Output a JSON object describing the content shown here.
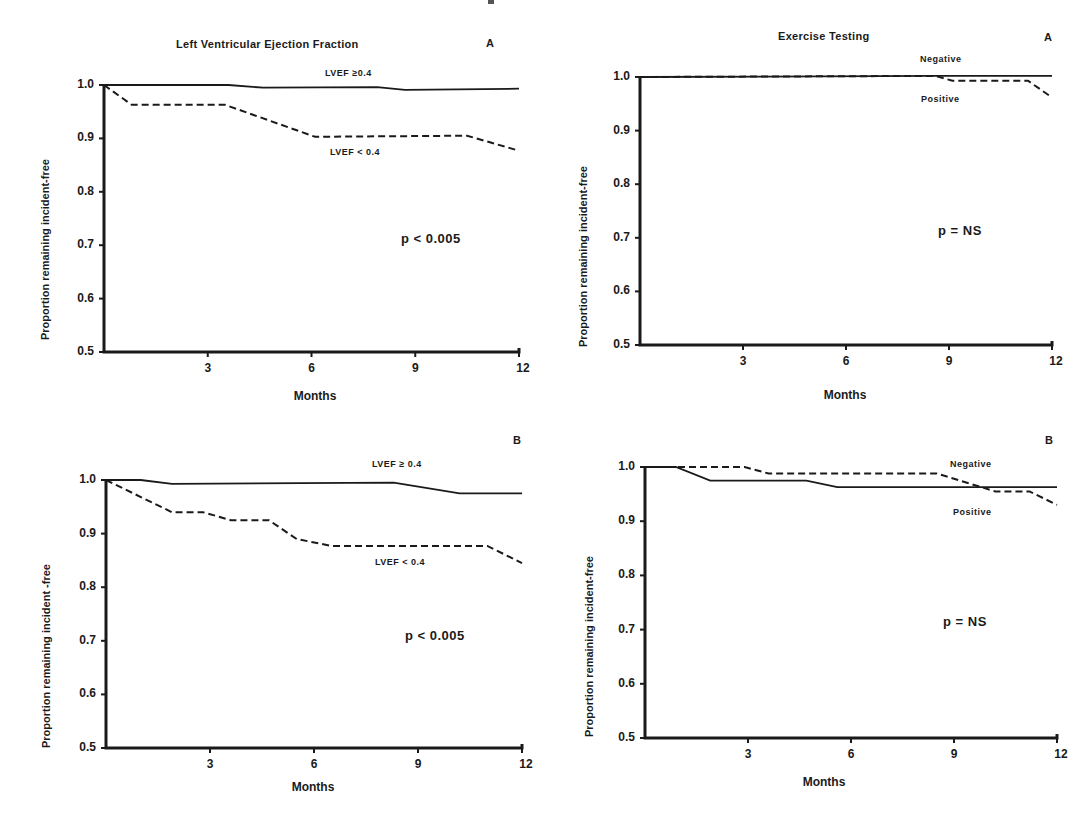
{
  "chart_data": [
    {
      "id": "tl",
      "type": "line",
      "title": "Left Ventricular Ejection Fraction",
      "panel_letter": "A",
      "xlabel": "Months",
      "ylabel": "Proportion remaining incident-free",
      "xlim": [
        0,
        12
      ],
      "ylim": [
        0.5,
        1.0
      ],
      "xticks": [
        "3",
        "6",
        "9",
        "12"
      ],
      "yticks": [
        "1.0",
        "0.9",
        "0.8",
        "0.7",
        "0.6",
        "0.5"
      ],
      "annotation": "p < 0.005",
      "grid": false,
      "series": [
        {
          "name": "LVEF ≥ 0.4",
          "label": "LVEF ≥0.4",
          "style": "solid",
          "x": [
            0,
            3.6,
            4.6,
            7.9,
            8.7,
            12
          ],
          "y": [
            1.0,
            1.0,
            0.995,
            0.996,
            0.991,
            0.993
          ]
        },
        {
          "name": "LVEF < 0.4",
          "label": "LVEF < 0.4",
          "style": "dashed",
          "x": [
            0,
            0.8,
            3.5,
            6.1,
            10.5,
            12
          ],
          "y": [
            1.0,
            0.963,
            0.963,
            0.903,
            0.905,
            0.877
          ]
        }
      ]
    },
    {
      "id": "tr",
      "type": "line",
      "title": "Exercise Testing",
      "panel_letter": "A",
      "xlabel": "Months",
      "ylabel": "Proportion remaining incident-free",
      "xlim": [
        0,
        12
      ],
      "ylim": [
        0.5,
        1.0
      ],
      "xticks": [
        "3",
        "6",
        "9",
        "12"
      ],
      "yticks": [
        "1.0",
        "0.9",
        "0.8",
        "0.7",
        "0.6",
        "0.5"
      ],
      "annotation": "p = NS",
      "grid": false,
      "series": [
        {
          "name": "Negative",
          "label": "Negative",
          "style": "solid",
          "x": [
            0,
            8.6,
            12
          ],
          "y": [
            1.0,
            1.002,
            1.002
          ]
        },
        {
          "name": "Positive",
          "label": "Positive",
          "style": "dashed",
          "x": [
            0,
            8.6,
            9.1,
            11.3,
            12
          ],
          "y": [
            1.0,
            1.002,
            0.993,
            0.993,
            0.962
          ]
        }
      ]
    },
    {
      "id": "bl",
      "type": "line",
      "title": "",
      "panel_letter": "B",
      "xlabel": "Months",
      "ylabel": "Proportion remaining incident -free",
      "xlim": [
        0,
        12
      ],
      "ylim": [
        0.5,
        1.0
      ],
      "xticks": [
        "3",
        "6",
        "9",
        "12"
      ],
      "yticks": [
        "1.0",
        "0.9",
        "0.8",
        "0.7",
        "0.6",
        "0.5"
      ],
      "annotation": "p < 0.005",
      "grid": false,
      "series": [
        {
          "name": "LVEF ≥ 0.4",
          "label": "LVEF ≥ 0.4",
          "style": "solid",
          "x": [
            0,
            1.0,
            1.9,
            8.3,
            10.2,
            12
          ],
          "y": [
            1.0,
            1.0,
            0.993,
            0.995,
            0.975,
            0.975
          ]
        },
        {
          "name": "LVEF < 0.4",
          "label": "LVEF < 0.4",
          "style": "dashed",
          "x": [
            0,
            1.9,
            2.8,
            3.6,
            4.7,
            5.5,
            6.5,
            11.0,
            12
          ],
          "y": [
            1.0,
            0.94,
            0.94,
            0.925,
            0.925,
            0.89,
            0.877,
            0.877,
            0.845
          ]
        }
      ]
    },
    {
      "id": "br",
      "type": "line",
      "title": "",
      "panel_letter": "B",
      "xlabel": "Months",
      "ylabel": "Proportion remaining incident-free",
      "xlim": [
        0,
        12
      ],
      "ylim": [
        0.5,
        1.0
      ],
      "xticks": [
        "3",
        "6",
        "9",
        "12"
      ],
      "yticks": [
        "1.0",
        "0.9",
        "0.8",
        "0.7",
        "0.6",
        "0.5"
      ],
      "annotation": "p = NS",
      "grid": false,
      "series": [
        {
          "name": "Negative",
          "label": "Negative",
          "style": "dashed",
          "x": [
            0,
            2.9,
            3.6,
            8.5,
            10.2,
            11.2,
            12
          ],
          "y": [
            1.0,
            1.0,
            0.988,
            0.988,
            0.955,
            0.955,
            0.93
          ]
        },
        {
          "name": "Positive",
          "label": "Positive",
          "style": "solid",
          "x": [
            0,
            0.9,
            1.9,
            4.7,
            5.6,
            12
          ],
          "y": [
            1.0,
            1.0,
            0.975,
            0.975,
            0.963,
            0.963
          ]
        }
      ]
    }
  ],
  "panels": {
    "tl": {
      "title": "Left Ventricular Ejection Fraction",
      "letter": "A",
      "ylabel": "Proportion remaining incident-free",
      "xlabel": "Months",
      "pval": "p < 0.005",
      "label_upper": "LVEF ≥0.4",
      "label_lower": "LVEF < 0.4"
    },
    "tr": {
      "title": "Exercise Testing",
      "letter": "A",
      "ylabel": "Proportion remaining incident-free",
      "xlabel": "Months",
      "pval": "p = NS",
      "label_upper": "Negative",
      "label_lower": "Positive"
    },
    "bl": {
      "letter": "B",
      "ylabel": "Proportion remaining incident -free",
      "xlabel": "Months",
      "pval": "p < 0.005",
      "label_upper": "LVEF ≥ 0.4",
      "label_lower": "LVEF < 0.4"
    },
    "br": {
      "letter": "B",
      "ylabel": "Proportion remaining incident-free",
      "xlabel": "Months",
      "pval": "p = NS",
      "label_upper": "Negative",
      "label_lower": "Positive"
    }
  },
  "ticks": {
    "y": [
      "1.0",
      "0.9",
      "0.8",
      "0.7",
      "0.6",
      "0.5"
    ],
    "x": [
      "3",
      "6",
      "9",
      "12"
    ]
  }
}
